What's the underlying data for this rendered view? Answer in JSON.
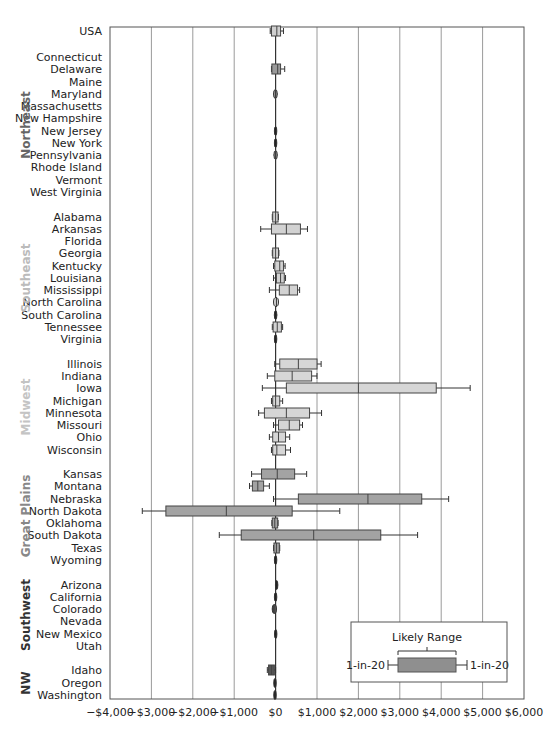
{
  "chart_data": {
    "type": "boxplot",
    "orientation": "horizontal",
    "title": "",
    "xlabel": "",
    "ylabel": "",
    "xlim": [
      -4000,
      6000
    ],
    "x_ticks": [
      -4000,
      -3000,
      -2000,
      -1000,
      0,
      1000,
      2000,
      3000,
      4000,
      5000,
      6000
    ],
    "x_tick_labels": [
      "−$4,000",
      "−$3,000",
      "−$2,000",
      "−$1,000",
      "$0",
      "$1,000",
      "$2,000",
      "$3,000",
      "$4,000",
      "$5,000",
      "$6,000"
    ],
    "grid": "vertical",
    "legend": {
      "title": "Likely Range",
      "left_whisker_label": "1-in-20",
      "right_whisker_label": "1-in-20",
      "position": "lower right"
    },
    "colors": {
      "usa_box": "#cfcfcf",
      "northeast_box": "#9a9a9a",
      "southeast_box": "#d2d2d2",
      "midwest_box": "#d6d6d6",
      "great_plains_box": "#a3a3a3",
      "southwest_box": "#555555",
      "nw_box": "#555555",
      "legend_box": "#8f8f8f"
    },
    "groups": [
      {
        "region": "",
        "label_color": "#222222",
        "box_color": "#cfcfcf",
        "rows": [
          {
            "name": "USA",
            "y": 31,
            "lo": -130,
            "q1": -100,
            "med": 30,
            "q3": 120,
            "hi": 190
          }
        ]
      },
      {
        "region": "Northeast",
        "label_color": "#666666",
        "box_color": "#9a9a9a",
        "label_y": 125,
        "rows": [
          {
            "name": "Connecticut",
            "y": 57,
            "lo": 0,
            "q1": 0,
            "med": 0,
            "q3": 0,
            "hi": 0
          },
          {
            "name": "Delaware",
            "y": 69,
            "lo": -100,
            "q1": -90,
            "med": 50,
            "q3": 120,
            "hi": 220
          },
          {
            "name": "Maine",
            "y": 82,
            "lo": 0,
            "q1": 0,
            "med": 0,
            "q3": 0,
            "hi": 0
          },
          {
            "name": "Maryland",
            "y": 94,
            "lo": -60,
            "q1": -50,
            "med": 0,
            "q3": 40,
            "hi": 50
          },
          {
            "name": "Massachusetts",
            "y": 106,
            "lo": 0,
            "q1": 0,
            "med": 0,
            "q3": 0,
            "hi": 0
          },
          {
            "name": "New Hampshire",
            "y": 118,
            "lo": 0,
            "q1": 0,
            "med": 0,
            "q3": 0,
            "hi": 0
          },
          {
            "name": "New Jersey",
            "y": 131,
            "lo": -10,
            "q1": -5,
            "med": 0,
            "q3": 5,
            "hi": 10
          },
          {
            "name": "New York",
            "y": 143,
            "lo": -20,
            "q1": -15,
            "med": 0,
            "q3": 15,
            "hi": 20
          },
          {
            "name": "Pennsylvania",
            "y": 155,
            "lo": -50,
            "q1": -40,
            "med": 0,
            "q3": 40,
            "hi": 50
          },
          {
            "name": "Rhode Island",
            "y": 167,
            "lo": 0,
            "q1": 0,
            "med": 0,
            "q3": 0,
            "hi": 0
          },
          {
            "name": "Vermont",
            "y": 180,
            "lo": 0,
            "q1": 0,
            "med": 0,
            "q3": 0,
            "hi": 0
          },
          {
            "name": "West Virginia",
            "y": 192,
            "lo": 0,
            "q1": 0,
            "med": 0,
            "q3": 0,
            "hi": 0
          }
        ]
      },
      {
        "region": "Southeast",
        "label_color": "#bbbbbb",
        "box_color": "#d2d2d2",
        "label_y": 278,
        "rows": [
          {
            "name": "Alabama",
            "y": 217,
            "lo": -80,
            "q1": -70,
            "med": 0,
            "q3": 60,
            "hi": 70
          },
          {
            "name": "Arkansas",
            "y": 229,
            "lo": -360,
            "q1": -100,
            "med": 260,
            "q3": 600,
            "hi": 770
          },
          {
            "name": "Florida",
            "y": 241,
            "lo": 0,
            "q1": 0,
            "med": 0,
            "q3": 0,
            "hi": 0
          },
          {
            "name": "Georgia",
            "y": 253,
            "lo": -80,
            "q1": -70,
            "med": 0,
            "q3": 70,
            "hi": 80
          },
          {
            "name": "Kentucky",
            "y": 266,
            "lo": -50,
            "q1": -20,
            "med": 100,
            "q3": 190,
            "hi": 230
          },
          {
            "name": "Louisiana",
            "y": 278,
            "lo": -50,
            "q1": 20,
            "med": 120,
            "q3": 210,
            "hi": 240
          },
          {
            "name": "Mississippi",
            "y": 290,
            "lo": -150,
            "q1": 90,
            "med": 330,
            "q3": 530,
            "hi": 580
          },
          {
            "name": "North Carolina",
            "y": 302,
            "lo": -60,
            "q1": -50,
            "med": 20,
            "q3": 70,
            "hi": 80
          },
          {
            "name": "South Carolina",
            "y": 315,
            "lo": -40,
            "q1": -30,
            "med": 0,
            "q3": 30,
            "hi": 40
          },
          {
            "name": "Tennessee",
            "y": 327,
            "lo": -80,
            "q1": -60,
            "med": 40,
            "q3": 140,
            "hi": 170
          },
          {
            "name": "Virginia",
            "y": 339,
            "lo": -30,
            "q1": -25,
            "med": 0,
            "q3": 25,
            "hi": 30
          }
        ]
      },
      {
        "region": "Midwest",
        "label_color": "#c4c4c4",
        "box_color": "#d6d6d6",
        "label_y": 407,
        "rows": [
          {
            "name": "Illinois",
            "y": 364,
            "lo": -20,
            "q1": 100,
            "med": 550,
            "q3": 1000,
            "hi": 1100
          },
          {
            "name": "Indiana",
            "y": 376,
            "lo": -200,
            "q1": -20,
            "med": 400,
            "q3": 870,
            "hi": 1000
          },
          {
            "name": "Iowa",
            "y": 388,
            "lo": -320,
            "q1": 260,
            "med": 2000,
            "q3": 3880,
            "hi": 4700
          },
          {
            "name": "Michigan",
            "y": 401,
            "lo": -100,
            "q1": -70,
            "med": 0,
            "q3": 100,
            "hi": 170
          },
          {
            "name": "Minnesota",
            "y": 413,
            "lo": -410,
            "q1": -270,
            "med": 260,
            "q3": 820,
            "hi": 1110
          },
          {
            "name": "Missouri",
            "y": 425,
            "lo": -50,
            "q1": 70,
            "med": 330,
            "q3": 580,
            "hi": 650
          },
          {
            "name": "Ohio",
            "y": 437,
            "lo": -150,
            "q1": -70,
            "med": 70,
            "q3": 240,
            "hi": 340
          },
          {
            "name": "Wisconsin",
            "y": 450,
            "lo": -100,
            "q1": -70,
            "med": 30,
            "q3": 240,
            "hi": 360
          }
        ]
      },
      {
        "region": "Great Plains",
        "label_color": "#888888",
        "box_color": "#a3a3a3",
        "label_y": 516,
        "rows": [
          {
            "name": "Kansas",
            "y": 474,
            "lo": -580,
            "q1": -340,
            "med": 40,
            "q3": 460,
            "hi": 750
          },
          {
            "name": "Montana",
            "y": 486,
            "lo": -630,
            "q1": -560,
            "med": -430,
            "q3": -290,
            "hi": -150
          },
          {
            "name": "Nebraska",
            "y": 499,
            "lo": -50,
            "q1": 550,
            "med": 2230,
            "q3": 3530,
            "hi": 4180
          },
          {
            "name": "North Dakota",
            "y": 511,
            "lo": -3220,
            "q1": -2650,
            "med": -1190,
            "q3": 400,
            "hi": 1550
          },
          {
            "name": "Oklahoma",
            "y": 523,
            "lo": -90,
            "q1": -80,
            "med": -20,
            "q3": 50,
            "hi": 60
          },
          {
            "name": "South Dakota",
            "y": 535,
            "lo": -1360,
            "q1": -830,
            "med": 920,
            "q3": 2540,
            "hi": 3430
          },
          {
            "name": "Texas",
            "y": 548,
            "lo": -50,
            "q1": -40,
            "med": 20,
            "q3": 90,
            "hi": 100
          },
          {
            "name": "Wyoming",
            "y": 560,
            "lo": -10,
            "q1": -5,
            "med": 0,
            "q3": 5,
            "hi": 10
          }
        ]
      },
      {
        "region": "Southwest",
        "label_color": "#333333",
        "box_color": "#555555",
        "label_y": 615,
        "rows": [
          {
            "name": "Arizona",
            "y": 585,
            "lo": -10,
            "q1": 0,
            "med": 30,
            "q3": 50,
            "hi": 60
          },
          {
            "name": "California",
            "y": 597,
            "lo": -10,
            "q1": -5,
            "med": 0,
            "q3": 5,
            "hi": 10
          },
          {
            "name": "Colorado",
            "y": 609,
            "lo": -90,
            "q1": -80,
            "med": -40,
            "q3": 20,
            "hi": 30
          },
          {
            "name": "Nevada",
            "y": 621,
            "lo": 0,
            "q1": 0,
            "med": 0,
            "q3": 0,
            "hi": 0
          },
          {
            "name": "New Mexico",
            "y": 634,
            "lo": -15,
            "q1": -10,
            "med": 0,
            "q3": 15,
            "hi": 20
          },
          {
            "name": "Utah",
            "y": 646,
            "lo": 0,
            "q1": 0,
            "med": 0,
            "q3": 0,
            "hi": 0
          }
        ]
      },
      {
        "region": "NW",
        "label_color": "#333333",
        "box_color": "#555555",
        "label_y": 683,
        "rows": [
          {
            "name": "Idaho",
            "y": 670,
            "lo": -200,
            "q1": -170,
            "med": -100,
            "q3": -30,
            "hi": 0
          },
          {
            "name": "Oregon",
            "y": 683,
            "lo": -40,
            "q1": -30,
            "med": -20,
            "q3": 0,
            "hi": 10
          },
          {
            "name": "Washington",
            "y": 695,
            "lo": -40,
            "q1": -30,
            "med": -20,
            "q3": 0,
            "hi": 10
          }
        ]
      }
    ]
  }
}
